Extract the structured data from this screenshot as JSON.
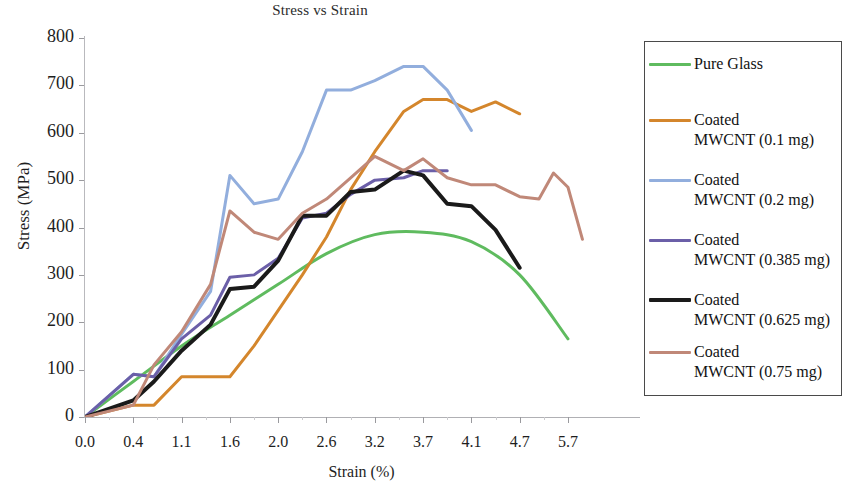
{
  "chart_data": {
    "type": "line",
    "title": "Stress vs Strain",
    "xlabel": "Strain (%)",
    "ylabel": "Stress (MPa)",
    "x_tick_labels": [
      "0.0",
      "0.4",
      "1.1",
      "1.6",
      "2.0",
      "2.6",
      "3.2",
      "3.7",
      "4.1",
      "4.7",
      "5.7"
    ],
    "y_tick_labels": [
      "800",
      "700",
      "600",
      "500",
      "400",
      "300",
      "200",
      "100",
      "0"
    ],
    "ylim": [
      0,
      800
    ],
    "y_tick_step": 100,
    "x_axis_type": "categorical-uneven",
    "grid": false,
    "legend_position": "right-outside",
    "series": [
      {
        "name": "Pure Glass",
        "color": "#5fbb5f",
        "width": 3,
        "smooth": true,
        "x": [
          0.0,
          0.4,
          1.1,
          1.6,
          2.0,
          2.6,
          3.2,
          3.7,
          4.1,
          4.7,
          5.7
        ],
        "values": [
          0,
          75,
          150,
          215,
          280,
          345,
          385,
          390,
          370,
          300,
          165
        ]
      },
      {
        "name": "Coated MWCNT (0.1 mg)",
        "color": "#d4862c",
        "width": 3,
        "smooth": false,
        "x": [
          0.0,
          0.4,
          0.7,
          1.1,
          1.4,
          1.6,
          1.8,
          2.0,
          2.3,
          2.6,
          2.9,
          3.2,
          3.5,
          3.7,
          3.9,
          4.1,
          4.4,
          4.7
        ],
        "values": [
          0,
          25,
          25,
          85,
          85,
          85,
          150,
          225,
          300,
          380,
          480,
          560,
          645,
          670,
          670,
          645,
          665,
          640
        ]
      },
      {
        "name": "Coated MWCNT (0.2 mg)",
        "color": "#92aedd",
        "width": 3,
        "smooth": false,
        "x": [
          0.0,
          0.4,
          0.7,
          1.1,
          1.4,
          1.6,
          1.8,
          2.0,
          2.3,
          2.6,
          2.9,
          3.2,
          3.5,
          3.7,
          3.9,
          4.1
        ],
        "values": [
          0,
          90,
          85,
          175,
          265,
          510,
          450,
          460,
          560,
          690,
          690,
          710,
          740,
          740,
          690,
          605
        ]
      },
      {
        "name": "Coated MWCNT (0.385 mg)",
        "color": "#6b5fa8",
        "width": 3,
        "smooth": false,
        "x": [
          0.0,
          0.4,
          0.7,
          1.1,
          1.4,
          1.6,
          1.8,
          2.0,
          2.3,
          2.6,
          2.9,
          3.2,
          3.5,
          3.7,
          3.9
        ],
        "values": [
          0,
          90,
          85,
          165,
          215,
          295,
          300,
          335,
          420,
          430,
          470,
          500,
          505,
          520,
          520
        ]
      },
      {
        "name": "Coated MWCNT (0.625 mg)",
        "color": "#1a1a1a",
        "width": 4,
        "smooth": false,
        "x": [
          0.0,
          0.4,
          0.7,
          1.1,
          1.4,
          1.6,
          1.8,
          2.0,
          2.3,
          2.6,
          2.9,
          3.2,
          3.5,
          3.7,
          3.9,
          4.1,
          4.4,
          4.7
        ],
        "values": [
          0,
          35,
          75,
          140,
          195,
          270,
          275,
          330,
          425,
          425,
          475,
          480,
          520,
          510,
          450,
          445,
          395,
          315
        ]
      },
      {
        "name": "Coated MWCNT (0.75 mg)",
        "color": "#c08878",
        "width": 3,
        "smooth": false,
        "x": [
          0.0,
          0.4,
          0.7,
          1.1,
          1.4,
          1.6,
          1.8,
          2.0,
          2.3,
          2.6,
          2.9,
          3.2,
          3.5,
          3.7,
          3.9,
          4.1,
          4.4,
          4.7,
          5.1,
          5.4,
          5.7,
          6.0
        ],
        "values": [
          0,
          25,
          110,
          180,
          280,
          435,
          390,
          375,
          430,
          460,
          505,
          550,
          520,
          545,
          505,
          490,
          490,
          465,
          460,
          515,
          485,
          375
        ]
      }
    ]
  },
  "legend": {
    "items": [
      {
        "label": "Pure Glass",
        "color": "#5fbb5f"
      },
      {
        "label": "Coated\nMWCNT (0.1 mg)",
        "color": "#d4862c"
      },
      {
        "label": "Coated\nMWCNT (0.2 mg)",
        "color": "#92aedd"
      },
      {
        "label": "Coated\nMWCNT (0.385 mg)",
        "color": "#6b5fa8"
      },
      {
        "label": "Coated\nMWCNT (0.625 mg)",
        "color": "#1a1a1a"
      },
      {
        "label": "Coated\nMWCNT (0.75 mg)",
        "color": "#c08878"
      }
    ]
  }
}
